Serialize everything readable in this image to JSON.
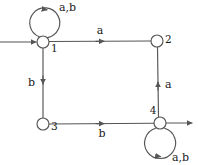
{
  "diagram": {
    "type": "state-machine",
    "stroke_color": "#555555",
    "text_color": "#1a1a1a",
    "background_color": "#ffffff",
    "node_fill": "#ffffff",
    "nodes": [
      {
        "id": "1",
        "label": "1",
        "cx": 43,
        "cy": 42,
        "r": 6
      },
      {
        "id": "2",
        "label": "2",
        "cx": 157,
        "cy": 41,
        "r": 6
      },
      {
        "id": "3",
        "label": "3",
        "cx": 43,
        "cy": 124,
        "r": 6
      },
      {
        "id": "4",
        "label": "4",
        "cx": 160,
        "cy": 123,
        "r": 6
      }
    ],
    "edges": [
      {
        "id": "start-to-1",
        "from": "start",
        "to": "1",
        "label": ""
      },
      {
        "id": "1-to-1",
        "from": "1",
        "to": "1",
        "label": "a,b"
      },
      {
        "id": "1-to-2",
        "from": "1",
        "to": "2",
        "label": "a"
      },
      {
        "id": "1-to-3",
        "from": "1",
        "to": "3",
        "label": "b"
      },
      {
        "id": "3-to-4",
        "from": "3",
        "to": "4",
        "label": "b"
      },
      {
        "id": "4-to-2",
        "from": "4",
        "to": "2",
        "label": "a"
      },
      {
        "id": "4-to-4",
        "from": "4",
        "to": "4",
        "label": "a,b"
      },
      {
        "id": "4-to-exit",
        "from": "4",
        "to": "exit",
        "label": ""
      }
    ],
    "labels": {
      "loop1": "a,b",
      "edge_1_2": "a",
      "edge_1_3": "b",
      "edge_3_4": "b",
      "edge_4_2": "a",
      "loop4": "a,b",
      "node1": "1",
      "node2": "2",
      "node3": "3",
      "node4": "4"
    }
  }
}
